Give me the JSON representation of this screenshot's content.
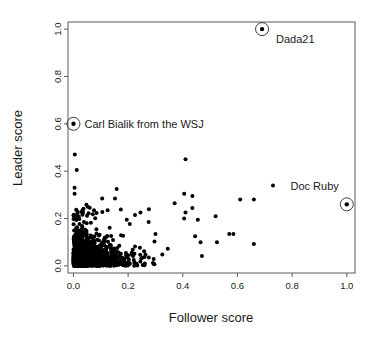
{
  "chart_data": {
    "type": "scatter",
    "title": "",
    "xlabel": "Follower score",
    "ylabel": "Leader score",
    "xlim": [
      -0.02,
      1.03
    ],
    "ylim": [
      -0.03,
      1.03
    ],
    "xticks": [
      0.0,
      0.2,
      0.4,
      0.6,
      0.8,
      1.0
    ],
    "yticks": [
      0.0,
      0.2,
      0.4,
      0.6,
      0.8,
      1.0
    ],
    "xtick_labels": [
      "0.0",
      "0.2",
      "0.4",
      "0.6",
      "0.8",
      "1.0"
    ],
    "ytick_labels": [
      "0.0",
      "0.2",
      "0.4",
      "0.6",
      "0.8",
      "1.0"
    ],
    "grid": false,
    "legend": false,
    "point_color": "#000000",
    "point_size": 2.0,
    "frame_color": "#5a5a5a",
    "annotated_points": [
      {
        "label": "Dada21",
        "x": 0.69,
        "y": 1.0,
        "label_dx": 14,
        "label_dy": 14,
        "anchor": "start"
      },
      {
        "label": "Carl Bialik from the WSJ",
        "x": 0.0,
        "y": 0.6,
        "label_dx": 11,
        "label_dy": 4,
        "anchor": "start"
      },
      {
        "label": "Doc Ruby",
        "x": 1.0,
        "y": 0.26,
        "label_dx": -8,
        "label_dy": -14,
        "anchor": "end"
      }
    ],
    "notable_points": [
      {
        "x": 0.005,
        "y": 0.47
      },
      {
        "x": 0.012,
        "y": 0.405
      },
      {
        "x": 0.004,
        "y": 0.33
      },
      {
        "x": 0.004,
        "y": 0.305
      },
      {
        "x": 0.105,
        "y": 0.285
      },
      {
        "x": 0.152,
        "y": 0.285
      },
      {
        "x": 0.158,
        "y": 0.325
      },
      {
        "x": 0.41,
        "y": 0.45
      },
      {
        "x": 0.405,
        "y": 0.305
      },
      {
        "x": 0.435,
        "y": 0.295
      },
      {
        "x": 0.37,
        "y": 0.265
      },
      {
        "x": 0.435,
        "y": 0.245
      },
      {
        "x": 0.41,
        "y": 0.225
      },
      {
        "x": 0.405,
        "y": 0.2
      },
      {
        "x": 0.455,
        "y": 0.195
      },
      {
        "x": 0.52,
        "y": 0.21
      },
      {
        "x": 0.61,
        "y": 0.28
      },
      {
        "x": 0.66,
        "y": 0.28
      },
      {
        "x": 0.73,
        "y": 0.34
      },
      {
        "x": 0.57,
        "y": 0.135
      },
      {
        "x": 0.585,
        "y": 0.135
      },
      {
        "x": 0.525,
        "y": 0.1
      },
      {
        "x": 0.66,
        "y": 0.092
      },
      {
        "x": 0.47,
        "y": 0.042
      },
      {
        "x": 0.465,
        "y": 0.1
      },
      {
        "x": 0.445,
        "y": 0.125
      },
      {
        "x": 0.345,
        "y": 0.072
      },
      {
        "x": 0.325,
        "y": 0.048
      },
      {
        "x": 0.3,
        "y": 0.135
      },
      {
        "x": 0.275,
        "y": 0.185
      },
      {
        "x": 0.245,
        "y": 0.225
      },
      {
        "x": 0.225,
        "y": 0.215
      },
      {
        "x": 0.195,
        "y": 0.195
      },
      {
        "x": 0.125,
        "y": 0.235
      },
      {
        "x": 0.075,
        "y": 0.235
      },
      {
        "x": 0.052,
        "y": 0.25
      },
      {
        "x": 0.035,
        "y": 0.225
      }
    ],
    "cluster": {
      "description": "dense saturated mass of points concentrated near the origin, decaying with follower score and leader score",
      "n_points": 1400,
      "x_decay": 0.055,
      "y_decay": 0.045,
      "x_max": 0.33,
      "y_max": 0.28,
      "seed": 20240917
    }
  },
  "figure": {
    "background": "#ffffff",
    "plot_area": {
      "left": 68,
      "top": 22,
      "right": 355,
      "bottom": 273
    }
  }
}
